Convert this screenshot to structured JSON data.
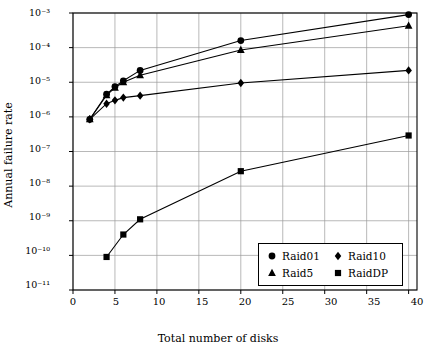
{
  "chart_data": {
    "type": "line",
    "title": "",
    "xlabel": "Total number of disks",
    "ylabel": "Annual failure rate",
    "xlim": [
      0,
      41
    ],
    "ylim_log": [
      1e-11,
      0.001
    ],
    "xticks": [
      0,
      5,
      10,
      15,
      20,
      25,
      30,
      35,
      40
    ],
    "yticks": [
      "10^-11",
      "10^-10",
      "10^-9",
      "10^-8",
      "10^-7",
      "10^-6",
      "10^-5",
      "10^-4",
      "10^-3"
    ],
    "ytick_labels": [
      "10⁻¹¹",
      "10⁻¹⁰",
      "10⁻⁹",
      "10⁻⁸",
      "10⁻⁷",
      "10⁻⁶",
      "10⁻⁵",
      "10⁻⁴",
      "10⁻³"
    ],
    "grid": true,
    "legend_position": "bottom-right",
    "series": [
      {
        "name": "Raid01",
        "marker": "circle",
        "x": [
          2,
          4,
          5,
          6,
          8,
          20,
          40
        ],
        "y": [
          8.5e-07,
          4.5e-06,
          7.5e-06,
          1.1e-05,
          2.2e-05,
          0.00016,
          0.0009
        ]
      },
      {
        "name": "Raid10",
        "marker": "diamond",
        "x": [
          2,
          4,
          5,
          6,
          8,
          20,
          40
        ],
        "y": [
          8.5e-07,
          2.4e-06,
          3e-06,
          3.6e-06,
          4.1e-06,
          9.5e-06,
          2.2e-05
        ]
      },
      {
        "name": "Raid5",
        "marker": "triangle",
        "x": [
          2,
          4,
          5,
          6,
          8,
          20,
          40
        ],
        "y": [
          8.5e-07,
          4.2e-06,
          7e-06,
          1e-05,
          1.6e-05,
          8.5e-05,
          0.00043
        ]
      },
      {
        "name": "RaidDP",
        "marker": "square",
        "x": [
          4,
          6,
          8,
          20,
          40
        ],
        "y": [
          9e-11,
          4e-10,
          1.1e-09,
          2.7e-08,
          2.9e-07
        ]
      }
    ],
    "legend": [
      {
        "label": "Raid01",
        "marker": "circle"
      },
      {
        "label": "Raid10",
        "marker": "diamond"
      },
      {
        "label": "Raid5",
        "marker": "triangle"
      },
      {
        "label": "RaidDP",
        "marker": "square"
      }
    ],
    "colors": {
      "line": "#000000",
      "marker": "#000000",
      "grid": "#9a9a9a",
      "axis": "#000000",
      "background": "#ffffff"
    }
  }
}
